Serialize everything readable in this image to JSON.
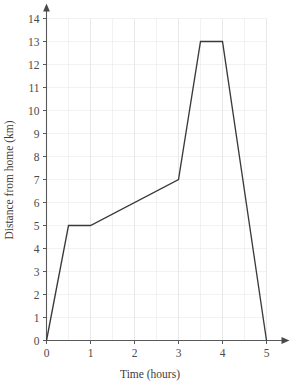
{
  "chart_data": {
    "type": "line",
    "title": "",
    "subtitle": "",
    "xlabel": "Time (hours)",
    "ylabel": "Distance from home (km)",
    "xlim": [
      0,
      5
    ],
    "ylim": [
      0,
      14
    ],
    "xticks": [
      0,
      1,
      2,
      3,
      4,
      5
    ],
    "xtick_labels": [
      "0",
      "1",
      "2",
      "3",
      "4",
      "5"
    ],
    "yticks": [
      0,
      1,
      2,
      3,
      4,
      5,
      6,
      7,
      8,
      9,
      10,
      11,
      12,
      13,
      14
    ],
    "ytick_labels": [
      "0",
      "1",
      "2",
      "3",
      "4",
      "5",
      "6",
      "7",
      "8",
      "9",
      "10",
      "11",
      "12",
      "13",
      "14"
    ],
    "grid": true,
    "grid_minor_step_x": 0.5,
    "grid_minor_step_y": 1,
    "legend": false,
    "legend_position": "none",
    "series": [
      {
        "name": "Distance from home",
        "color": "#3a3a3a",
        "x": [
          0,
          0.5,
          1,
          3,
          3.5,
          4,
          5
        ],
        "y": [
          0,
          5,
          5,
          7,
          13,
          13,
          0
        ],
        "points": [
          {
            "x": 0,
            "y": 0
          },
          {
            "x": 0.5,
            "y": 5
          },
          {
            "x": 1,
            "y": 5
          },
          {
            "x": 3,
            "y": 7
          },
          {
            "x": 3.5,
            "y": 13
          },
          {
            "x": 4,
            "y": 13
          },
          {
            "x": 5,
            "y": 0
          }
        ]
      }
    ],
    "annotations": [],
    "axis_arrows": {
      "x": true,
      "y": true
    }
  },
  "axes": {
    "x_title": "Time (hours)",
    "y_title": "Distance from home (km)"
  }
}
